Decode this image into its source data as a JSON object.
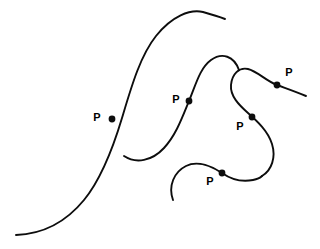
{
  "figure": {
    "canvas": {
      "width": 320,
      "height": 249
    },
    "background_color": "#ffffff",
    "stroke_color": "#0d0d0d",
    "label_color": "#000000",
    "stroke_width": 1.9,
    "marker_radius": 3.4,
    "label_text": "P"
  },
  "curves": [
    {
      "name": "large-left-sigmoid-curve",
      "description": "Long S-shaped curve sweeping from bottom-left up to a crest at top-center-right",
      "stroke_width": 1.9,
      "d": "M 16 235 C 44 234 66 222 84 200 C 102 178 113 148 122 118 C 131 88 140 56 156 36 C 172 16 190 9 203 12 C 214 15 220 17 225 19"
    },
    {
      "name": "middle-s-curve",
      "description": "S-shaped curve from lower-left hook rising through point P to a rounded crest and down to the right",
      "stroke_width": 1.9,
      "d": "M 124 156 C 136 164 152 161 164 148 C 176 135 182 118 189 101 C 196 84 200 68 211 60 C 222 52 234 56 239 70"
    },
    {
      "name": "right-hook-curve",
      "description": "Hook curve descending from the upper right tail through P, curling left and down into a deep loop",
      "stroke_width": 1.9,
      "d": "M 306 96 C 294 91 285 88 277 85 C 266 81 257 71 248 69 C 239 67 232 74 231 85 C 230 96 239 105 248 113 C 257 121 268 131 272 144 C 276 157 272 170 262 176"
    },
    {
      "name": "bottom-arc-curve",
      "description": "Arc from lower-left rising over a crest through point P and descending to the right to meet the hook loop",
      "stroke_width": 1.9,
      "d": "M 173 200 C 168 186 174 172 186 166 C 198 160 213 167 222 173 C 232 180 243 182 253 180 C 258 179 260 178 262 176"
    }
  ],
  "points": [
    {
      "name": "point-p-1",
      "label": "P",
      "marker": {
        "cx": 112,
        "cy": 119,
        "r": 3.4
      },
      "label_pos": {
        "x": 97,
        "y": 118
      }
    },
    {
      "name": "point-p-2",
      "label": "P",
      "marker": {
        "cx": 189,
        "cy": 101,
        "r": 3.4
      },
      "label_pos": {
        "x": 176,
        "y": 100
      }
    },
    {
      "name": "point-p-3",
      "label": "P",
      "marker": {
        "cx": 277,
        "cy": 85,
        "r": 3.4
      },
      "label_pos": {
        "x": 289,
        "y": 73
      }
    },
    {
      "name": "point-p-4",
      "label": "P",
      "marker": {
        "cx": 252,
        "cy": 117,
        "r": 3.4
      },
      "label_pos": {
        "x": 240,
        "y": 127
      }
    },
    {
      "name": "point-p-5",
      "label": "P",
      "marker": {
        "cx": 222,
        "cy": 173,
        "r": 3.4
      },
      "label_pos": {
        "x": 210,
        "y": 182
      }
    }
  ]
}
